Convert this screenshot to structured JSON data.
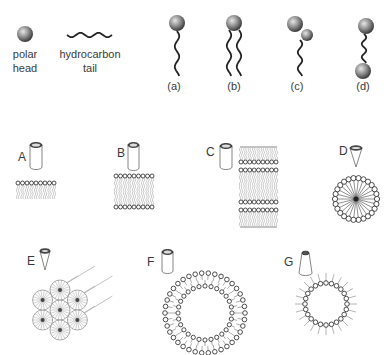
{
  "legend": {
    "head": {
      "line1": "polar",
      "line2": "head",
      "cx": 25,
      "cy": 34,
      "r": 8
    },
    "tail": {
      "line1": "hydrocarbon",
      "line2": "tail",
      "x1": 67,
      "x2": 112,
      "y": 35
    }
  },
  "molecule_types": [
    {
      "id": "a",
      "label": "(a)",
      "desc": "single head, single tail",
      "x": 177,
      "heads": [
        {
          "cx": 177,
          "cy": 23,
          "r": 8
        }
      ],
      "tails": [
        {
          "x": 177,
          "y1": 31,
          "y2": 76
        }
      ],
      "label_x": 174
    },
    {
      "id": "b",
      "label": "(b)",
      "desc": "single head, double tail",
      "x": 234,
      "heads": [
        {
          "cx": 234,
          "cy": 23,
          "r": 8
        }
      ],
      "tails": [
        {
          "x": 229,
          "y1": 30,
          "y2": 76
        },
        {
          "x": 239,
          "y1": 30,
          "y2": 76
        }
      ],
      "label_x": 234
    },
    {
      "id": "c",
      "label": "(c)",
      "desc": "large head plus small head, single tail",
      "x": 298,
      "heads": [
        {
          "cx": 295,
          "cy": 24,
          "r": 8
        },
        {
          "cx": 307,
          "cy": 35,
          "r": 6
        }
      ],
      "tails": [
        {
          "x": 300,
          "y1": 40,
          "y2": 76
        }
      ],
      "label_x": 297
    },
    {
      "id": "d",
      "label": "(d)",
      "desc": "bolaamphiphile, heads at both ends",
      "x": 364,
      "heads": [
        {
          "cx": 366,
          "cy": 26,
          "r": 8
        },
        {
          "cx": 363,
          "cy": 71,
          "r": 8
        }
      ],
      "tails": [
        {
          "x": 364,
          "y1": 34,
          "y2": 63
        }
      ],
      "label_x": 363
    }
  ],
  "label_y": 90,
  "panels": [
    {
      "id": "A",
      "label": "A",
      "shape": "cylinder",
      "structure": "monolayer",
      "label_pos": [
        18,
        161
      ],
      "shape_box": [
        30,
        145,
        12,
        22
      ],
      "struct_box": [
        18,
        183,
        36,
        16
      ]
    },
    {
      "id": "B",
      "label": "B",
      "shape": "cylinder",
      "structure": "bilayer",
      "label_pos": [
        117,
        157
      ],
      "shape_box": [
        128,
        145,
        11,
        23
      ],
      "struct_box": [
        116,
        176,
        36,
        31
      ]
    },
    {
      "id": "C",
      "label": "C",
      "shape": "cylinder",
      "structure": "multilamellar stack",
      "label_pos": [
        206,
        156
      ],
      "shape_box": [
        220,
        146,
        12,
        21
      ],
      "struct_box": [
        240,
        147,
        37,
        80
      ]
    },
    {
      "id": "D",
      "label": "D",
      "shape": "cone",
      "structure": "spherical micelle",
      "label_pos": [
        339,
        155
      ],
      "shape_box": [
        350,
        148,
        12,
        19
      ],
      "struct": {
        "cx": 356,
        "cy": 199,
        "r": 21
      }
    },
    {
      "id": "E",
      "label": "E",
      "shape": "cone",
      "structure": "hexagonal cylindrical micelles",
      "label_pos": [
        27,
        265
      ],
      "shape_box": [
        40,
        251,
        10,
        19
      ],
      "struct": {
        "cx": 60,
        "cy": 310,
        "r": 10
      }
    },
    {
      "id": "F",
      "label": "F",
      "shape": "cylinder",
      "structure": "vesicle (liposome)",
      "label_pos": [
        147,
        266
      ],
      "shape_box": [
        162,
        252,
        11,
        19
      ],
      "struct": {
        "cx": 205,
        "cy": 313,
        "r_out": 40,
        "r_in": 27
      }
    },
    {
      "id": "G",
      "label": "G",
      "shape": "inverted-cone",
      "structure": "inverted micelle",
      "label_pos": [
        284,
        266
      ],
      "shape_box": [
        299,
        253,
        13,
        20
      ],
      "struct": {
        "cx": 326,
        "cy": 304,
        "r": 21
      }
    }
  ],
  "colors": {
    "head_light": "#d8d8d8",
    "head_dark": "#4a4a4a",
    "line": "#2a2a2a",
    "faint": "#8a8a8a",
    "text": "#3a3a3a"
  }
}
